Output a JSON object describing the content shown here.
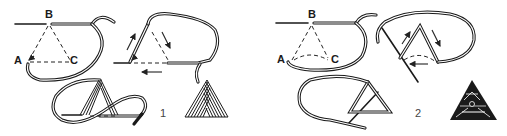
{
  "diagram": {
    "type": "embroidery-stitch-instructions",
    "figures": [
      {
        "number": "1",
        "point_labels": {
          "a": "A",
          "b": "B",
          "c": "C"
        },
        "steps": [
          "setup-triangle",
          "stitch-around-triangle",
          "loop-figure-eight",
          "finished-motif"
        ]
      },
      {
        "number": "2",
        "point_labels": {
          "a": "A",
          "b": "B",
          "c": "C"
        },
        "steps": [
          "setup-triangle",
          "stitch-around-triangle",
          "loop-around-triangle",
          "finished-motif"
        ]
      }
    ]
  },
  "colors": {
    "ink": "#1a1a1a",
    "background": "#ffffff"
  }
}
